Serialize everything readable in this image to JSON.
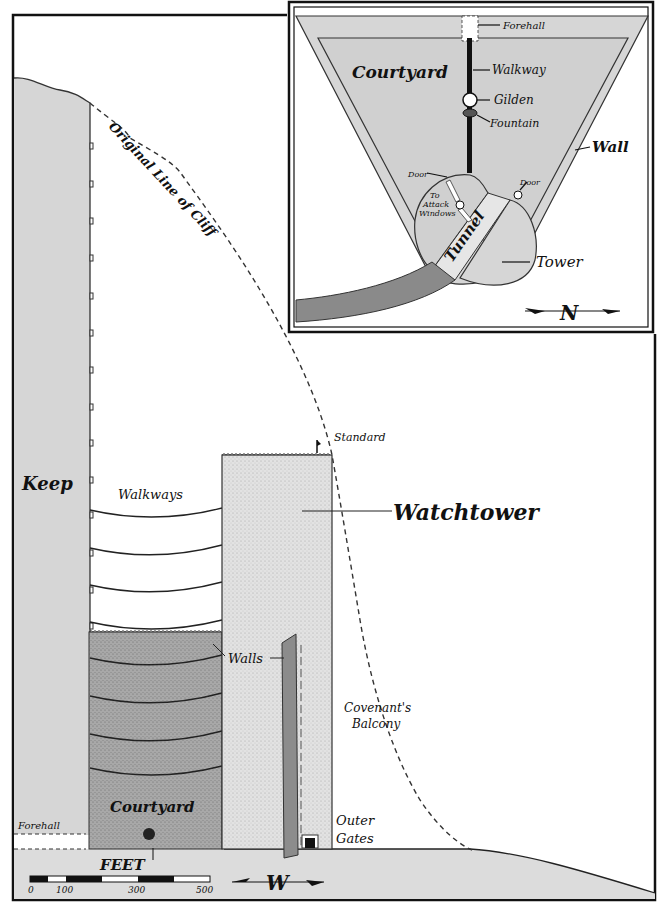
{
  "main_view": {
    "labels": {
      "original_cliff": "Original Line of Cliff",
      "keep": "Keep",
      "walkways": "Walkways",
      "standard": "Standard",
      "watchtower": "Watchtower",
      "walls": "Walls",
      "covenants_balcony_1": "Covenant's",
      "covenants_balcony_2": "Balcony",
      "courtyard": "Courtyard",
      "forehall": "Forehall",
      "outer_gates_1": "Outer",
      "outer_gates_2": "Gates"
    },
    "scale": {
      "unit": "FEET",
      "ticks": [
        "0",
        "100",
        "300",
        "500"
      ]
    },
    "compass": {
      "letter": "W"
    }
  },
  "inset_view": {
    "labels": {
      "forehall": "Forehall",
      "courtyard": "Courtyard",
      "walkway": "Walkway",
      "gilden": "Gilden",
      "fountain": "Fountain",
      "wall": "Wall",
      "door_left": "Door",
      "door_right": "Door",
      "to_attack_1": "To",
      "to_attack_2": "Attack",
      "to_attack_3": "Windows",
      "tunnel": "Tunnel",
      "tower": "Tower"
    },
    "compass": {
      "letter": "N"
    }
  },
  "colors": {
    "ink": "#111111",
    "stone_light": "#d8d8d8",
    "stone_mid": "#9a9a9a",
    "stone_dark": "#7a7a7a",
    "paper": "#ffffff"
  }
}
